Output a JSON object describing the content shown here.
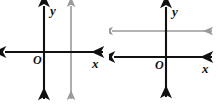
{
  "figures": [
    {
      "id": "figure-left",
      "name": "coordinate-plane-vertical-line",
      "labels": {
        "origin": "O",
        "x_axis": "x",
        "y_axis": "y"
      },
      "colors": {
        "axis": "#111111",
        "extra_line": "#9a9a9a"
      },
      "axes": {
        "x_axis": {
          "y": 52,
          "x_start": 4,
          "x_end": 104,
          "arrows": "both"
        },
        "y_axis": {
          "x": 44,
          "y_start": 5,
          "y_end": 100,
          "arrows": "both"
        }
      },
      "extra_line": {
        "orientation": "vertical",
        "description": "gray line parallel to the y-axis",
        "x": 71,
        "y_start": 5,
        "y_end": 100,
        "arrows": "both"
      },
      "label_positions": {
        "origin": {
          "x": 33,
          "y": 64
        },
        "x_axis": {
          "x": 92,
          "y": 68
        },
        "y_axis": {
          "x": 50,
          "y": 15
        }
      }
    },
    {
      "id": "figure-right",
      "name": "coordinate-plane-horizontal-line",
      "labels": {
        "origin": "O",
        "x_axis": "x",
        "y_axis": "y"
      },
      "colors": {
        "axis": "#111111",
        "extra_line": "#9a9a9a"
      },
      "axes": {
        "x_axis": {
          "y": 57,
          "x_start": 4,
          "x_end": 104,
          "arrows": "both"
        },
        "y_axis": {
          "x": 57,
          "y_start": 6,
          "y_end": 98,
          "arrows": "both"
        }
      },
      "extra_line": {
        "orientation": "horizontal",
        "description": "gray line parallel to the x-axis",
        "y": 31,
        "x_start": 2,
        "x_end": 104,
        "arrows": "both"
      },
      "label_positions": {
        "origin": {
          "x": 46,
          "y": 69
        },
        "x_axis": {
          "x": 93,
          "y": 73
        },
        "y_axis": {
          "x": 63,
          "y": 16
        }
      }
    }
  ]
}
